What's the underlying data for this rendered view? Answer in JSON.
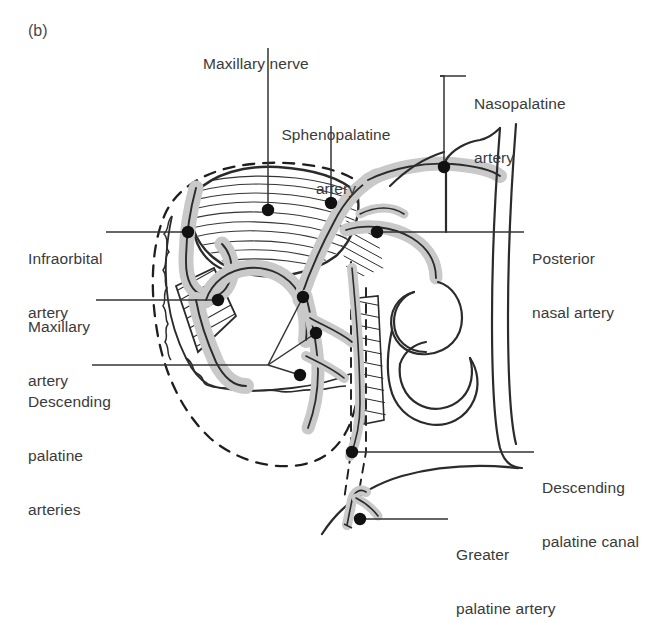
{
  "figure": {
    "panel_letter": "(b)",
    "caption_present": false,
    "style": {
      "background": "#ffffff",
      "ink": "#2b2b2b",
      "label_text_color": "#3a3a3a",
      "artery_fill": "#c9c9c9",
      "artery_outline": "#2b2b2b",
      "marker_color": "#111111",
      "leader_color": "#333333",
      "dashed_outline_color": "#1e1e1e"
    }
  },
  "labels": [
    {
      "id": "maxillary-nerve",
      "text": "Maxillary nerve",
      "lines": [
        "Maxillary nerve"
      ],
      "position": "top-center",
      "leader": "vertical line down to marker on striated nerve trunk",
      "marker": {
        "x": 268,
        "y": 210
      }
    },
    {
      "id": "sphenopalatine-artery",
      "text": "Sphenopalatine artery",
      "lines": [
        "Sphenopalatine",
        "artery"
      ],
      "position": "top-center-right",
      "leader": "vertical line down to marker on artery",
      "marker": {
        "x": 331,
        "y": 203
      }
    },
    {
      "id": "nasopalatine-artery",
      "text": "Nasopalatine artery",
      "lines": [
        "Nasopalatine",
        "artery"
      ],
      "position": "top-right",
      "leader": "bracket down then to marker",
      "marker": {
        "x": 444,
        "y": 167
      }
    },
    {
      "id": "posterior-nasal-artery",
      "text": "Posterior nasal artery",
      "lines": [
        "Posterior",
        "nasal artery"
      ],
      "position": "right",
      "leader": "horizontal line left to marker",
      "marker": {
        "x": 377,
        "y": 232
      }
    },
    {
      "id": "infraorbital-artery",
      "text": "Infraorbital artery",
      "lines": [
        "Infraorbital",
        "artery"
      ],
      "position": "left",
      "leader": "horizontal line right to marker",
      "marker": {
        "x": 188,
        "y": 232
      }
    },
    {
      "id": "maxillary-artery",
      "text": "Maxillary artery",
      "lines": [
        "Maxillary",
        "artery"
      ],
      "position": "left",
      "leader": "horizontal line right to marker",
      "marker": {
        "x": 218,
        "y": 300
      }
    },
    {
      "id": "descending-palatine-arteries",
      "text": "Descending palatine arteries",
      "lines": [
        "Descending",
        "palatine",
        "arteries"
      ],
      "position": "left",
      "leader": "horizontal line to fan of three leaders to three markers",
      "markers": [
        {
          "x": 303,
          "y": 297
        },
        {
          "x": 316,
          "y": 333
        },
        {
          "x": 300,
          "y": 375
        }
      ]
    },
    {
      "id": "descending-palatine-canal",
      "text": "Descending palatine canal",
      "lines": [
        "Descending",
        "palatine canal"
      ],
      "position": "bottom-right",
      "leader": "horizontal line left to marker on dashed canal",
      "marker": {
        "x": 352,
        "y": 452
      }
    },
    {
      "id": "greater-palatine-artery",
      "text": "Greater palatine artery",
      "lines": [
        "Greater",
        "palatine artery"
      ],
      "position": "bottom-right",
      "leader": "horizontal line left to marker at branching vessel",
      "marker": {
        "x": 360,
        "y": 519
      }
    }
  ],
  "structures": {
    "dashed_region": "pterygopalatine fossa boundary (dashed oval)",
    "dashed_canal": "descending palatine canal (vertical dashed pair)",
    "nerve_trunk": "striated maxillary nerve trunk",
    "turbinates": "S-shaped nasal turbinate scroll",
    "septum": "two long vertical curves forming nasal septum",
    "branching_vessel": "small greater palatine branching vessel at bottom"
  }
}
